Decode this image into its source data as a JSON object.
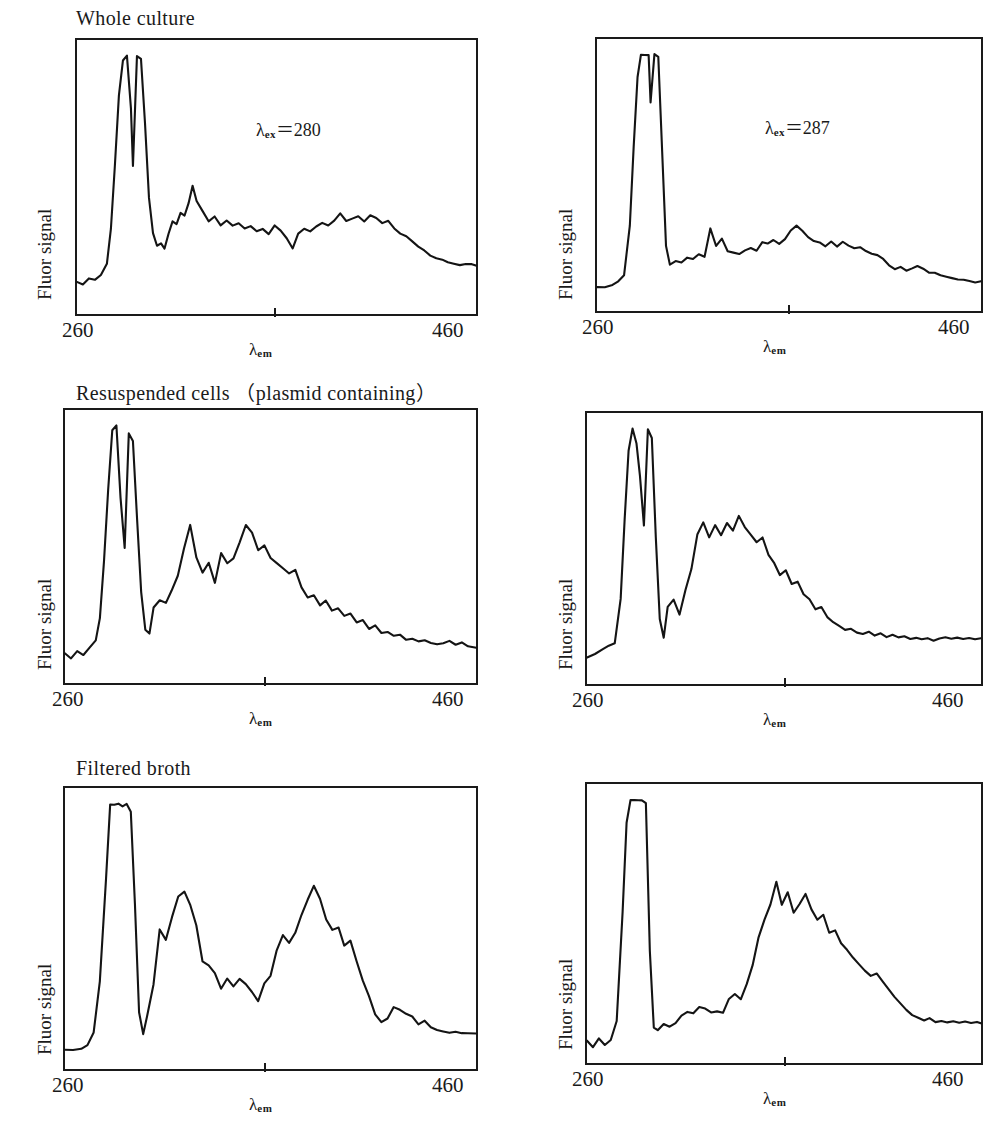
{
  "figure": {
    "n_rows": 3,
    "n_cols": 2,
    "line_color": "#141414",
    "frame_color": "#1a1a1a",
    "background": "#ffffff"
  },
  "axes": {
    "ylabel": "Fluor signal",
    "xlabel_base": "λ",
    "xlabel_sub": "em",
    "xtick_min": "260",
    "xtick_max": "460",
    "xlim": [
      260,
      460
    ],
    "mid_tick_value": 360
  },
  "row_titles": [
    "Whole culture",
    "Resuspended cells （plasmid containing）",
    "Filtered broth"
  ],
  "annotations": {
    "left_excitation": {
      "base": "λ",
      "sub": "ex",
      "eq": "＝",
      "value": "280"
    },
    "right_excitation": {
      "base": "λ",
      "sub": "ex",
      "eq": "＝",
      "value": "287"
    }
  },
  "chart_data": [
    {
      "type": "line",
      "panel": "row1-col1",
      "title": "Whole culture",
      "xlabel": "λem",
      "ylabel": "Fluor signal",
      "xlim": [
        260,
        460
      ],
      "ylim": [
        0,
        1
      ],
      "grid": false,
      "legend": "none",
      "annotation": "λex＝280",
      "x": [
        260,
        263,
        266,
        269,
        272,
        275,
        277,
        279,
        281,
        283,
        285,
        287,
        288,
        290,
        292,
        294,
        296,
        298,
        300,
        302,
        304,
        306,
        308,
        310,
        312,
        314,
        316,
        318,
        320,
        323,
        326,
        329,
        332,
        335,
        338,
        341,
        344,
        347,
        350,
        353,
        356,
        359,
        362,
        365,
        368,
        371,
        374,
        377,
        380,
        383,
        386,
        389,
        392,
        395,
        398,
        401,
        404,
        407,
        410,
        413,
        416,
        419,
        422,
        425,
        428,
        431,
        434,
        437,
        440,
        443,
        446,
        449,
        452,
        455,
        458,
        460
      ],
      "y": [
        0.085,
        0.075,
        0.1,
        0.095,
        0.115,
        0.16,
        0.3,
        0.55,
        0.83,
        0.97,
        0.99,
        0.78,
        0.55,
        0.99,
        0.98,
        0.72,
        0.42,
        0.28,
        0.23,
        0.24,
        0.22,
        0.28,
        0.33,
        0.32,
        0.36,
        0.35,
        0.4,
        0.47,
        0.41,
        0.37,
        0.33,
        0.35,
        0.31,
        0.33,
        0.31,
        0.32,
        0.3,
        0.31,
        0.29,
        0.3,
        0.28,
        0.31,
        0.29,
        0.26,
        0.22,
        0.28,
        0.3,
        0.29,
        0.31,
        0.32,
        0.31,
        0.33,
        0.36,
        0.33,
        0.34,
        0.35,
        0.33,
        0.35,
        0.34,
        0.32,
        0.33,
        0.3,
        0.28,
        0.27,
        0.25,
        0.23,
        0.21,
        0.19,
        0.18,
        0.175,
        0.165,
        0.16,
        0.155,
        0.16,
        0.155,
        0.15
      ]
    },
    {
      "type": "line",
      "panel": "row1-col2",
      "title": "Whole culture",
      "xlabel": "λem",
      "ylabel": "Fluor signal",
      "xlim": [
        260,
        460
      ],
      "ylim": [
        0,
        1
      ],
      "grid": false,
      "legend": "none",
      "annotation": "λex＝287",
      "x": [
        260,
        264,
        268,
        271,
        274,
        277,
        279,
        281,
        283,
        285,
        287,
        288,
        290,
        292,
        294,
        296,
        298,
        301,
        304,
        307,
        310,
        313,
        316,
        319,
        322,
        325,
        328,
        331,
        334,
        337,
        340,
        343,
        346,
        349,
        352,
        355,
        358,
        361,
        364,
        367,
        370,
        373,
        376,
        379,
        382,
        385,
        388,
        391,
        394,
        397,
        400,
        403,
        406,
        409,
        412,
        415,
        418,
        421,
        424,
        427,
        430,
        433,
        436,
        439,
        442,
        445,
        448,
        451,
        454,
        457,
        460
      ],
      "y": [
        0.055,
        0.055,
        0.065,
        0.075,
        0.1,
        0.3,
        0.62,
        0.9,
        0.99,
        0.99,
        0.99,
        0.8,
        0.99,
        0.98,
        0.6,
        0.22,
        0.145,
        0.16,
        0.155,
        0.175,
        0.165,
        0.185,
        0.175,
        0.29,
        0.22,
        0.25,
        0.2,
        0.195,
        0.19,
        0.2,
        0.21,
        0.2,
        0.235,
        0.23,
        0.245,
        0.23,
        0.25,
        0.28,
        0.3,
        0.28,
        0.255,
        0.24,
        0.235,
        0.22,
        0.24,
        0.215,
        0.235,
        0.22,
        0.21,
        0.215,
        0.2,
        0.19,
        0.185,
        0.17,
        0.14,
        0.125,
        0.135,
        0.12,
        0.13,
        0.14,
        0.13,
        0.115,
        0.11,
        0.1,
        0.095,
        0.09,
        0.085,
        0.085,
        0.08,
        0.075,
        0.075
      ]
    },
    {
      "type": "line",
      "panel": "row2-col1",
      "title": "Resuspended cells （plasmid containing）",
      "xlabel": "λem",
      "ylabel": "Fluor signal",
      "xlim": [
        260,
        460
      ],
      "ylim": [
        0,
        1
      ],
      "grid": false,
      "legend": "none",
      "x": [
        260,
        263,
        266,
        269,
        272,
        275,
        277,
        279,
        281,
        283,
        285,
        287,
        289,
        291,
        293,
        295,
        297,
        299,
        301,
        303,
        306,
        309,
        312,
        315,
        318,
        321,
        324,
        327,
        330,
        333,
        336,
        339,
        342,
        345,
        348,
        351,
        354,
        357,
        360,
        363,
        366,
        369,
        372,
        375,
        378,
        381,
        384,
        387,
        390,
        393,
        396,
        399,
        402,
        405,
        408,
        411,
        414,
        417,
        420,
        423,
        426,
        429,
        432,
        435,
        438,
        441,
        444,
        447,
        450,
        453,
        456,
        460
      ],
      "y": [
        0.075,
        0.055,
        0.085,
        0.07,
        0.1,
        0.13,
        0.22,
        0.45,
        0.73,
        0.97,
        0.99,
        0.7,
        0.5,
        0.96,
        0.93,
        0.62,
        0.32,
        0.17,
        0.155,
        0.26,
        0.29,
        0.28,
        0.33,
        0.39,
        0.5,
        0.59,
        0.46,
        0.4,
        0.44,
        0.36,
        0.48,
        0.44,
        0.46,
        0.52,
        0.59,
        0.56,
        0.49,
        0.51,
        0.46,
        0.44,
        0.42,
        0.4,
        0.41,
        0.34,
        0.3,
        0.31,
        0.27,
        0.29,
        0.25,
        0.26,
        0.225,
        0.235,
        0.2,
        0.21,
        0.175,
        0.19,
        0.16,
        0.165,
        0.145,
        0.15,
        0.13,
        0.135,
        0.125,
        0.13,
        0.12,
        0.115,
        0.12,
        0.125,
        0.11,
        0.12,
        0.105,
        0.1
      ]
    },
    {
      "type": "line",
      "panel": "row2-col2",
      "title": "Resuspended cells （plasmid containing）",
      "xlabel": "λem",
      "ylabel": "Fluor signal",
      "xlim": [
        260,
        460
      ],
      "ylim": [
        0,
        1
      ],
      "grid": false,
      "legend": "none",
      "x": [
        260,
        264,
        268,
        271,
        274,
        277,
        279,
        281,
        283,
        285,
        287,
        289,
        291,
        293,
        295,
        297,
        299,
        301,
        304,
        307,
        310,
        313,
        316,
        319,
        322,
        325,
        328,
        331,
        334,
        337,
        340,
        343,
        346,
        349,
        352,
        355,
        358,
        361,
        364,
        367,
        370,
        373,
        376,
        379,
        382,
        385,
        388,
        391,
        394,
        397,
        400,
        403,
        406,
        409,
        412,
        415,
        418,
        421,
        424,
        427,
        430,
        433,
        436,
        439,
        442,
        445,
        448,
        451,
        454,
        457,
        460
      ],
      "y": [
        0.065,
        0.08,
        0.1,
        0.115,
        0.12,
        0.3,
        0.62,
        0.9,
        0.99,
        0.93,
        0.8,
        0.6,
        0.99,
        0.95,
        0.55,
        0.22,
        0.145,
        0.27,
        0.3,
        0.24,
        0.34,
        0.42,
        0.56,
        0.61,
        0.55,
        0.6,
        0.56,
        0.61,
        0.58,
        0.64,
        0.59,
        0.56,
        0.53,
        0.55,
        0.48,
        0.45,
        0.4,
        0.42,
        0.36,
        0.37,
        0.32,
        0.3,
        0.26,
        0.27,
        0.23,
        0.21,
        0.19,
        0.175,
        0.18,
        0.165,
        0.16,
        0.17,
        0.155,
        0.165,
        0.15,
        0.155,
        0.145,
        0.15,
        0.14,
        0.145,
        0.14,
        0.145,
        0.135,
        0.14,
        0.145,
        0.14,
        0.145,
        0.14,
        0.145,
        0.14,
        0.145
      ]
    },
    {
      "type": "line",
      "panel": "row3-col1",
      "title": "Filtered broth",
      "xlabel": "λem",
      "ylabel": "Fluor signal",
      "xlim": [
        260,
        460
      ],
      "ylim": [
        0,
        1
      ],
      "grid": false,
      "legend": "none",
      "x": [
        260,
        264,
        268,
        271,
        274,
        277,
        280,
        282,
        284,
        286,
        288,
        290,
        292,
        294,
        296,
        298,
        300,
        303,
        306,
        309,
        312,
        315,
        318,
        321,
        324,
        327,
        330,
        333,
        336,
        339,
        342,
        345,
        348,
        351,
        354,
        357,
        360,
        363,
        366,
        369,
        372,
        375,
        378,
        381,
        384,
        387,
        390,
        393,
        396,
        399,
        402,
        405,
        408,
        411,
        414,
        417,
        420,
        423,
        426,
        429,
        432,
        435,
        438,
        441,
        444,
        447,
        450,
        453,
        456,
        460
      ],
      "y": [
        0.035,
        0.03,
        0.035,
        0.05,
        0.1,
        0.3,
        0.7,
        0.99,
        0.99,
        0.99,
        0.98,
        0.99,
        0.96,
        0.6,
        0.18,
        0.095,
        0.17,
        0.29,
        0.5,
        0.46,
        0.55,
        0.63,
        0.65,
        0.6,
        0.52,
        0.38,
        0.36,
        0.33,
        0.27,
        0.31,
        0.28,
        0.31,
        0.29,
        0.26,
        0.22,
        0.29,
        0.32,
        0.42,
        0.48,
        0.45,
        0.49,
        0.56,
        0.62,
        0.67,
        0.62,
        0.54,
        0.5,
        0.51,
        0.44,
        0.46,
        0.38,
        0.3,
        0.24,
        0.17,
        0.14,
        0.155,
        0.2,
        0.19,
        0.175,
        0.16,
        0.13,
        0.145,
        0.12,
        0.11,
        0.105,
        0.1,
        0.105,
        0.1,
        0.095,
        0.095
      ]
    },
    {
      "type": "line",
      "panel": "row3-col2",
      "title": "Filtered broth",
      "xlabel": "λem",
      "ylabel": "Fluor signal",
      "xlim": [
        260,
        460
      ],
      "ylim": [
        0,
        1
      ],
      "grid": false,
      "legend": "none",
      "x": [
        260,
        263,
        266,
        269,
        272,
        275,
        278,
        280,
        282,
        284,
        286,
        288,
        290,
        292,
        294,
        296,
        299,
        302,
        305,
        308,
        311,
        314,
        317,
        320,
        323,
        326,
        329,
        332,
        335,
        338,
        341,
        344,
        347,
        350,
        353,
        356,
        359,
        362,
        365,
        368,
        371,
        374,
        377,
        380,
        383,
        386,
        389,
        392,
        395,
        398,
        401,
        404,
        407,
        410,
        413,
        416,
        419,
        422,
        425,
        428,
        431,
        434,
        437,
        440,
        443,
        446,
        449,
        452,
        455,
        458,
        460
      ],
      "y": [
        0.045,
        0.02,
        0.055,
        0.03,
        0.05,
        0.12,
        0.55,
        0.9,
        0.99,
        0.99,
        0.99,
        0.99,
        0.98,
        0.4,
        0.095,
        0.085,
        0.11,
        0.1,
        0.115,
        0.145,
        0.16,
        0.155,
        0.175,
        0.17,
        0.155,
        0.16,
        0.155,
        0.21,
        0.23,
        0.21,
        0.27,
        0.34,
        0.45,
        0.52,
        0.58,
        0.67,
        0.58,
        0.63,
        0.55,
        0.58,
        0.62,
        0.56,
        0.52,
        0.54,
        0.47,
        0.48,
        0.43,
        0.4,
        0.37,
        0.345,
        0.32,
        0.3,
        0.31,
        0.28,
        0.25,
        0.22,
        0.19,
        0.165,
        0.145,
        0.135,
        0.125,
        0.135,
        0.12,
        0.125,
        0.115,
        0.12,
        0.115,
        0.12,
        0.115,
        0.12,
        0.115
      ]
    }
  ]
}
